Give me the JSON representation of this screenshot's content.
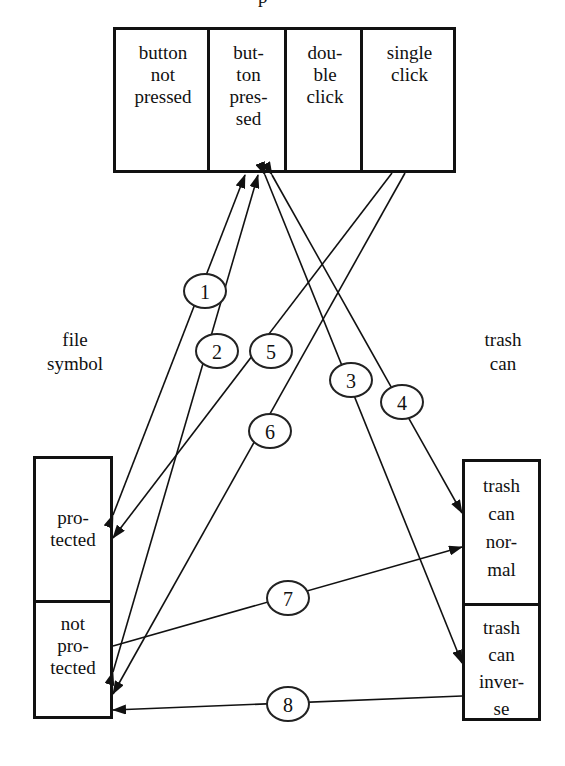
{
  "diagram": {
    "title_fragment": "p",
    "top_component": {
      "cells": [
        {
          "id": "button-not-pressed",
          "label": "button\nnot\npressed"
        },
        {
          "id": "button-pressed",
          "label": "but-\nton\npres-\nsed"
        },
        {
          "id": "double-click",
          "label": "dou-\nble\nclick"
        },
        {
          "id": "single-click",
          "label": "single\nclick"
        }
      ]
    },
    "left_component": {
      "label": "file\nsymbol",
      "cells": [
        {
          "id": "protected",
          "label": "pro-\ntected"
        },
        {
          "id": "not-protected",
          "label": "not\npro-\ntected"
        }
      ]
    },
    "right_component": {
      "label": "trash\ncan",
      "cells": [
        {
          "id": "trash-can-normal",
          "label": "trash\ncan\nnor-\nmal"
        },
        {
          "id": "trash-can-inverse",
          "label": "trash\ncan\ninver-\nse"
        }
      ]
    },
    "transitions": [
      {
        "number": "1",
        "from": "button-pressed",
        "to": "protected"
      },
      {
        "number": "2",
        "from": "button-pressed",
        "to": "not-protected"
      },
      {
        "number": "3",
        "from": "button-pressed",
        "to": "trash-can-inverse"
      },
      {
        "number": "4",
        "from": "button-pressed",
        "to": "trash-can-normal"
      },
      {
        "number": "5",
        "from": "single-click",
        "to": "protected"
      },
      {
        "number": "6",
        "from": "single-click",
        "to": "not-protected"
      },
      {
        "number": "7",
        "from": "not-protected",
        "to": "trash-can-normal"
      },
      {
        "number": "8",
        "from": "trash-can-inverse",
        "to": "not-protected"
      }
    ],
    "colors": {
      "ink": "#111111",
      "background": "#ffffff"
    }
  }
}
